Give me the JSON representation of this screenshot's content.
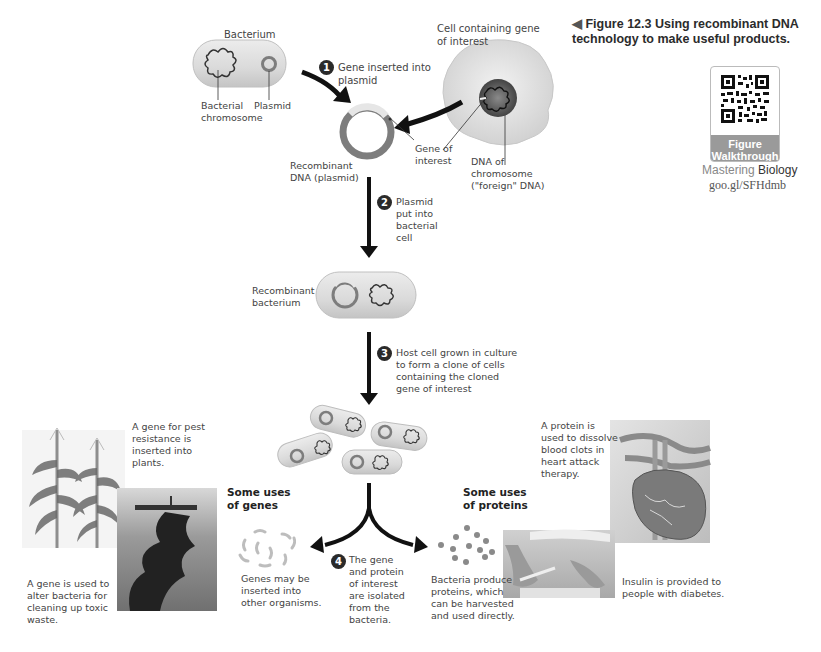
{
  "figure": {
    "caption_marker": "◀",
    "caption_number": "Figure 12.3",
    "caption_text_line1": "Using recombinant DNA",
    "caption_text_line2": "technology to make useful products."
  },
  "qr": {
    "label_line1": "Figure",
    "label_line2": "Walkthrough",
    "mastering_prefix": "Mastering",
    "mastering_suffix": "Biology",
    "url": "goo.gl/SFHdmb"
  },
  "top": {
    "bacterium_label": "Bacterium",
    "bacterial_chromosome_line1": "Bacterial",
    "bacterial_chromosome_line2": "chromosome",
    "plasmid_label": "Plasmid",
    "cell_label_line1": "Cell containing gene",
    "cell_label_line2": "of interest",
    "dna_of_chromosome_line1": "DNA of",
    "dna_of_chromosome_line2": "chromosome",
    "dna_of_chromosome_line3": "(\"foreign\" DNA)",
    "gene_of_interest_line1": "Gene of",
    "gene_of_interest_line2": "interest",
    "recombinant_dna_line1": "Recombinant",
    "recombinant_dna_line2": "DNA (plasmid)"
  },
  "steps": [
    {
      "number": "1",
      "lines": [
        "Gene inserted into",
        "plasmid"
      ]
    },
    {
      "number": "2",
      "lines": [
        "Plasmid",
        "put into",
        "bacterial",
        "cell"
      ]
    },
    {
      "number": "3",
      "lines": [
        "Host cell grown in culture",
        "to form a clone of cells",
        "containing the cloned",
        "gene of interest"
      ]
    },
    {
      "number": "4",
      "lines": [
        "The gene",
        "and protein",
        "of interest",
        "are isolated",
        "from the",
        "bacteria."
      ]
    }
  ],
  "middle": {
    "recombinant_bacterium_line1": "Recombinant",
    "recombinant_bacterium_line2": "bacterium"
  },
  "genes": {
    "heading_line1": "Some uses",
    "heading_line2": "of genes",
    "pest_resistance": [
      "A gene for pest",
      "resistance is",
      "inserted into",
      "plants."
    ],
    "toxic_waste": [
      "A gene is used to",
      "alter bacteria for",
      "cleaning up toxic",
      "waste."
    ],
    "genes_inserted": [
      "Genes may be",
      "inserted into",
      "other organisms."
    ]
  },
  "proteins": {
    "heading_line1": "Some uses",
    "heading_line2": "of proteins",
    "blood_clots": [
      "A protein is",
      "used to dissolve",
      "blood clots in",
      "heart attack",
      "therapy."
    ],
    "bacteria_produce": [
      "Bacteria produce",
      "proteins, which",
      "can be harvested",
      "and used directly."
    ],
    "insulin": [
      "Insulin is provided to",
      "people with diabetes."
    ]
  },
  "colors": {
    "cell_fill": "#dcdcdc",
    "plasmid_ring": "#808080",
    "gene_segment": "#e8e8e8",
    "arrow": "#111111",
    "step_circle": "#2a2a2a",
    "qr_footer": "#9a9a9a"
  }
}
